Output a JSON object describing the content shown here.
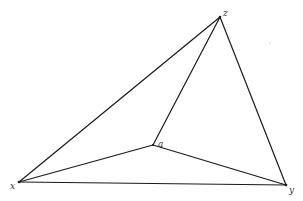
{
  "diagram": {
    "type": "graph",
    "vertices": [
      {
        "id": "z",
        "label": "z",
        "x": 220,
        "y": 17,
        "label_x": 224,
        "label_y": 16
      },
      {
        "id": "x",
        "label": "x",
        "x": 19,
        "y": 182,
        "label_x": 10,
        "label_y": 189
      },
      {
        "id": "y",
        "label": "y",
        "x": 286,
        "y": 185,
        "label_x": 289,
        "label_y": 193
      },
      {
        "id": "a",
        "label": "a",
        "x": 153,
        "y": 145,
        "label_x": 159,
        "label_y": 146
      }
    ],
    "edges": [
      {
        "from": "x",
        "to": "z"
      },
      {
        "from": "z",
        "to": "y"
      },
      {
        "from": "x",
        "to": "y"
      },
      {
        "from": "a",
        "to": "z"
      },
      {
        "from": "a",
        "to": "x"
      },
      {
        "from": "a",
        "to": "y"
      }
    ],
    "labels": {
      "z": "z",
      "x": "x",
      "y": "y",
      "a": "a"
    },
    "colors": {
      "line": "#1a1a1a",
      "background": "#ffffff",
      "label": "#333333"
    }
  }
}
